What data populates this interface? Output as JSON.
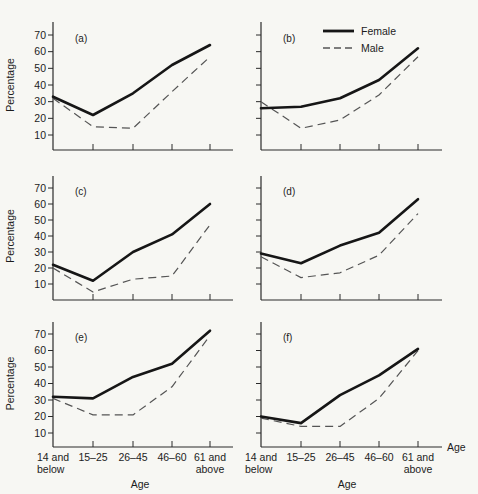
{
  "figure": {
    "background": "#f7f7f3",
    "ink_color": "#1c1c1c",
    "line_colors": {
      "female": "#161616",
      "male": "#555555"
    },
    "ylabel": "Percentage",
    "xlabel": "Age",
    "x_axis_end_label": "Age",
    "yticks": [
      10,
      20,
      30,
      40,
      50,
      60,
      70
    ],
    "x_tick_labels": [
      [
        "14 and",
        "below"
      ],
      [
        "15–25"
      ],
      [
        "26–45"
      ],
      [
        "46–60"
      ],
      [
        "61 and",
        "above"
      ]
    ]
  },
  "legend": {
    "position": "top-of-panel-b",
    "items": [
      {
        "label": "Female",
        "style": "solid"
      },
      {
        "label": "Male",
        "style": "dashed"
      }
    ]
  },
  "chart_data": [
    {
      "type": "line",
      "panel_label": "(a)",
      "categories": [
        "14 and below",
        "15–25",
        "26–45",
        "46–60",
        "61 and above"
      ],
      "ylabel": "Percentage",
      "xlabel": "Age",
      "ylim": [
        0,
        78
      ],
      "yticks": [
        10,
        20,
        30,
        40,
        50,
        60,
        70
      ],
      "grid": false,
      "series": [
        {
          "name": "Female",
          "style": "solid",
          "values": [
            33,
            22,
            35,
            52,
            64
          ]
        },
        {
          "name": "Male",
          "style": "dashed",
          "values": [
            32,
            15,
            14,
            36,
            57
          ]
        }
      ]
    },
    {
      "type": "line",
      "panel_label": "(b)",
      "categories": [
        "14 and below",
        "15–25",
        "26–45",
        "46–60",
        "61 and above"
      ],
      "ylabel": "",
      "xlabel": "Age",
      "ylim": [
        0,
        78
      ],
      "yticks": [
        10,
        20,
        30,
        40,
        50,
        60,
        70
      ],
      "grid": false,
      "has_legend": true,
      "series": [
        {
          "name": "Female",
          "style": "solid",
          "values": [
            26,
            27,
            32,
            43,
            62
          ]
        },
        {
          "name": "Male",
          "style": "dashed",
          "values": [
            30,
            14,
            19,
            34,
            57
          ]
        }
      ]
    },
    {
      "type": "line",
      "panel_label": "(c)",
      "categories": [
        "14 and below",
        "15–25",
        "26–45",
        "46–60",
        "61 and above"
      ],
      "ylabel": "Percentage",
      "xlabel": "Age",
      "ylim": [
        0,
        78
      ],
      "yticks": [
        10,
        20,
        30,
        40,
        50,
        60,
        70
      ],
      "grid": false,
      "series": [
        {
          "name": "Female",
          "style": "solid",
          "values": [
            22,
            12,
            30,
            41,
            60
          ]
        },
        {
          "name": "Male",
          "style": "dashed",
          "values": [
            20,
            5,
            13,
            15,
            47
          ]
        }
      ]
    },
    {
      "type": "line",
      "panel_label": "(d)",
      "categories": [
        "14 and below",
        "15–25",
        "26–45",
        "46–60",
        "61 and above"
      ],
      "ylabel": "",
      "xlabel": "Age",
      "ylim": [
        0,
        78
      ],
      "yticks": [
        10,
        20,
        30,
        40,
        50,
        60,
        70
      ],
      "grid": false,
      "series": [
        {
          "name": "Female",
          "style": "solid",
          "values": [
            29,
            23,
            34,
            42,
            63
          ]
        },
        {
          "name": "Male",
          "style": "dashed",
          "values": [
            27,
            14,
            17,
            28,
            54
          ]
        }
      ]
    },
    {
      "type": "line",
      "panel_label": "(e)",
      "categories": [
        "14 and below",
        "15–25",
        "26–45",
        "46–60",
        "61 and above"
      ],
      "ylabel": "Percentage",
      "xlabel": "Age",
      "ylim": [
        0,
        78
      ],
      "yticks": [
        10,
        20,
        30,
        40,
        50,
        60,
        70
      ],
      "grid": false,
      "series": [
        {
          "name": "Female",
          "style": "solid",
          "values": [
            32,
            31,
            44,
            52,
            72
          ]
        },
        {
          "name": "Male",
          "style": "dashed",
          "values": [
            31,
            21,
            21,
            38,
            69
          ]
        }
      ]
    },
    {
      "type": "line",
      "panel_label": "(f)",
      "categories": [
        "14 and below",
        "15–25",
        "26–45",
        "46–60",
        "61 and above"
      ],
      "ylabel": "",
      "xlabel": "Age",
      "ylim": [
        0,
        78
      ],
      "yticks": [
        10,
        20,
        30,
        40,
        50,
        60,
        70
      ],
      "grid": false,
      "series": [
        {
          "name": "Female",
          "style": "solid",
          "values": [
            20,
            16,
            33,
            45,
            61
          ]
        },
        {
          "name": "Male",
          "style": "dashed",
          "values": [
            19,
            14,
            14,
            31,
            60
          ]
        }
      ]
    }
  ]
}
